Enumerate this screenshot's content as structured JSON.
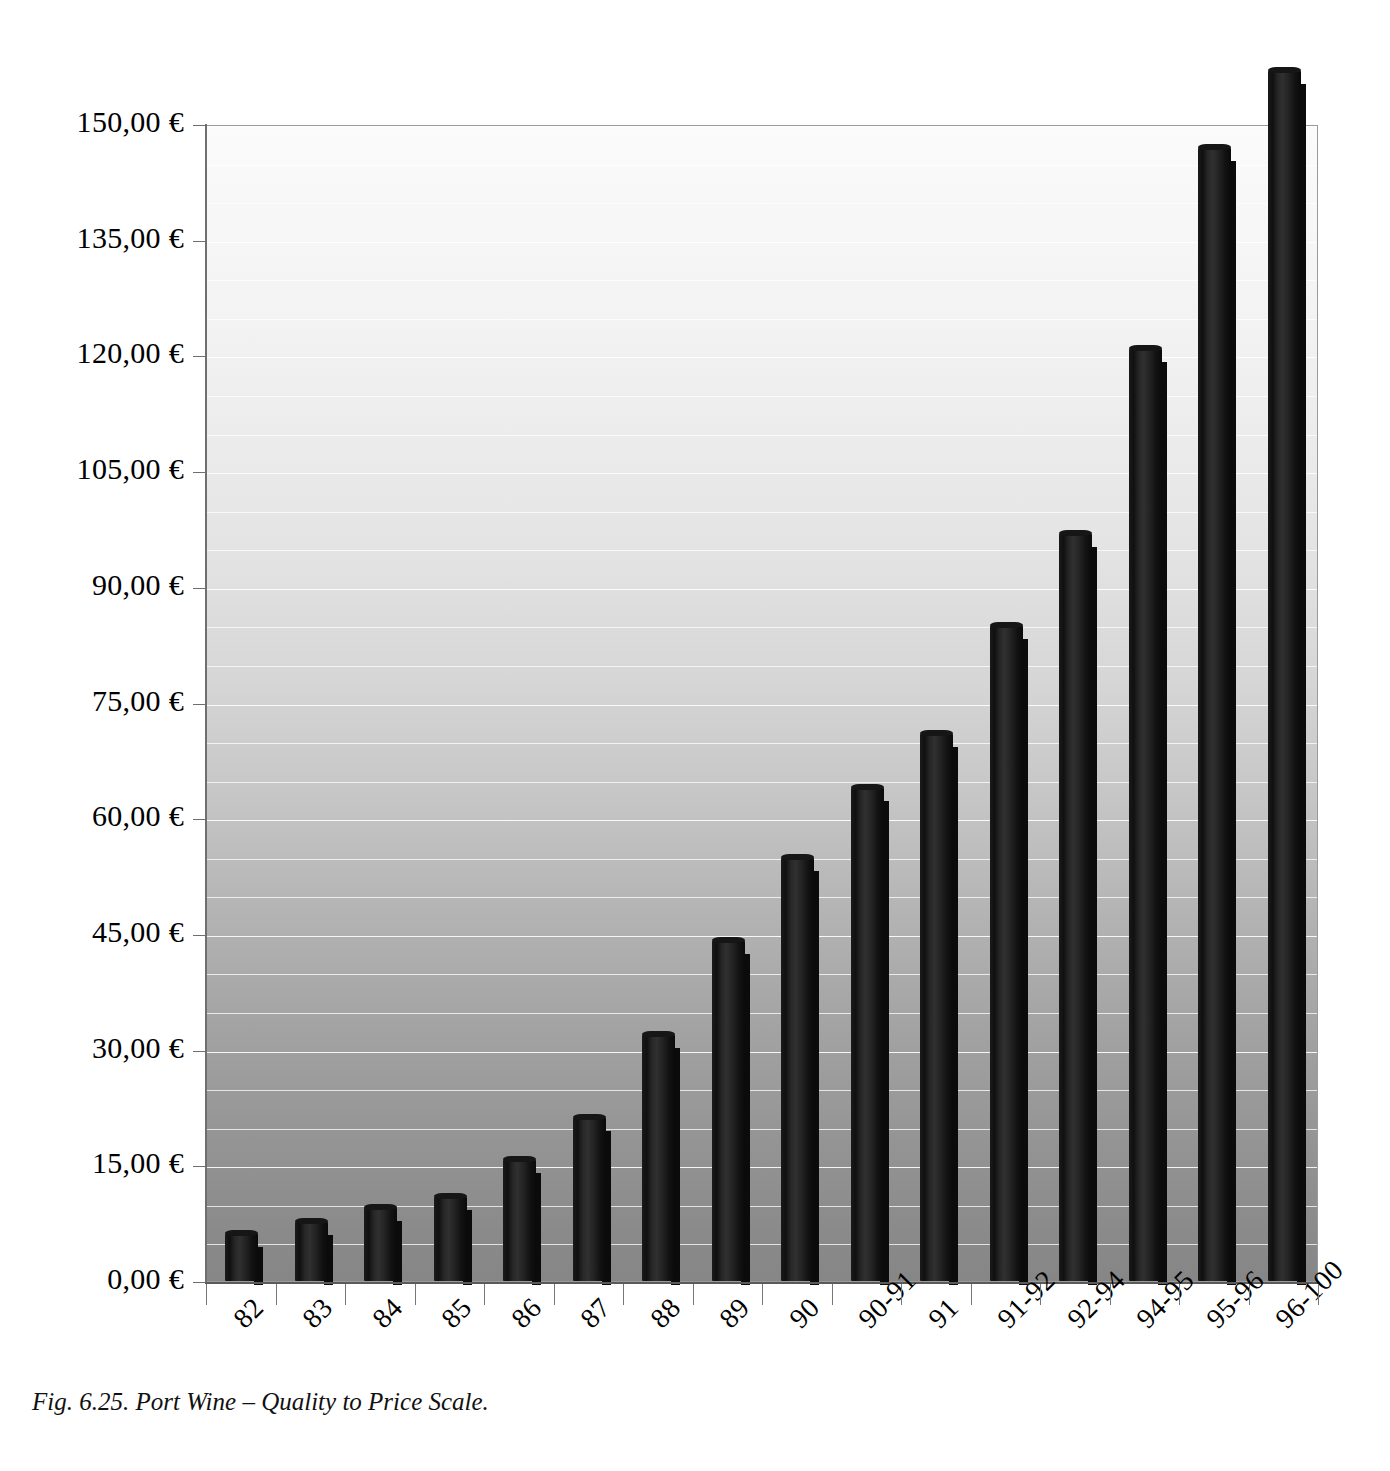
{
  "caption": "Fig. 6.25. Port Wine – Quality to Price Scale.",
  "chart_data": {
    "type": "bar",
    "title": "",
    "subtitle": "",
    "xlabel": "",
    "ylabel": "",
    "categories": [
      "82",
      "83",
      "84",
      "85",
      "86",
      "87",
      "88",
      "89",
      "90",
      "90-91",
      "91",
      "91-92",
      "92-94",
      "94-95",
      "95-96",
      "96-100"
    ],
    "values": [
      6.2,
      7.8,
      9.6,
      11.0,
      15.8,
      21.3,
      32.0,
      44.2,
      55.0,
      64.0,
      71.0,
      85.0,
      97.0,
      121.0,
      147.0,
      157.0
    ],
    "value_labels": [
      "6,20 €",
      "7,80 €",
      "9,60 €",
      "11,00 €",
      "15,80 €",
      "21,30 €",
      "32,00 €",
      "44,20 €",
      "55,00 €",
      "64,00 €",
      "71,00 €",
      "85,00 €",
      "97,00 €",
      "121,00 €",
      "147,00 €",
      "157,00 €"
    ],
    "ylim": [
      0,
      150
    ],
    "ytick_values": [
      0,
      15,
      30,
      45,
      60,
      75,
      90,
      105,
      120,
      135,
      150
    ],
    "ytick_labels": [
      "0,00 €",
      "15,00 €",
      "30,00 €",
      "45,00 €",
      "60,00 €",
      "75,00 €",
      "90,00 €",
      "105,00 €",
      "120,00 €",
      "135,00 €",
      "150,00 €"
    ],
    "minor_gridlines_per_interval": 2,
    "grid": true,
    "legend": false,
    "legend_position": "none",
    "bar_color": "#1a1a1a",
    "plot_background_top_color": "#fbfbfb",
    "plot_background_bottom_color": "#868686",
    "gridline_color": "#ffffff",
    "axis_color": "#6f6f6f",
    "xtick_label_rotation_degrees": -45,
    "currency_symbol": "€",
    "decimal_separator": ","
  }
}
